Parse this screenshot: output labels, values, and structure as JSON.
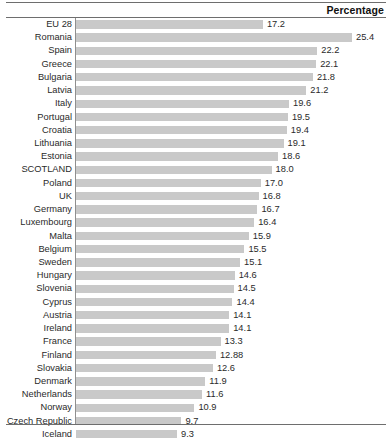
{
  "header": {
    "title": "Percentage"
  },
  "chart_data": {
    "type": "bar",
    "orientation": "horizontal",
    "title": "",
    "subtitle": "",
    "xlabel": "Percentage",
    "ylabel": "",
    "grid": false,
    "legend": null,
    "axis_origin": 0,
    "xlim": [
      0,
      25.4
    ],
    "bar_color": "#c9c9c9",
    "categories": [
      "EU 28",
      "Romania",
      "Spain",
      "Greece",
      "Bulgaria",
      "Latvia",
      "Italy",
      "Portugal",
      "Croatia",
      "Lithuania",
      "Estonia",
      "SCOTLAND",
      "Poland",
      "UK",
      "Germany",
      "Luxembourg",
      "Malta",
      "Belgium",
      "Sweden",
      "Hungary",
      "Slovenia",
      "Cyprus",
      "Austria",
      "Ireland",
      "France",
      "Finland",
      "Slovakia",
      "Denmark",
      "Netherlands",
      "Norway",
      "Czech Republic",
      "Iceland"
    ],
    "values": [
      17.2,
      25.4,
      22.2,
      22.1,
      21.8,
      21.2,
      19.6,
      19.5,
      19.4,
      19.1,
      18.6,
      18.0,
      17.0,
      16.8,
      16.7,
      16.4,
      15.9,
      15.5,
      15.1,
      14.6,
      14.5,
      14.4,
      14.1,
      14.1,
      13.3,
      12.88,
      12.6,
      11.9,
      11.6,
      10.9,
      9.7,
      9.3
    ],
    "value_labels": [
      "17.2",
      "25.4",
      "22.2",
      "22.1",
      "21.8",
      "21.2",
      "19.6",
      "19.5",
      "19.4",
      "19.1",
      "18.6",
      "18.0",
      "17.0",
      "16.8",
      "16.7",
      "16.4",
      "15.9",
      "15.5",
      "15.1",
      "14.6",
      "14.5",
      "14.4",
      "14.1",
      "14.1",
      "13.3",
      "12.88",
      "12.6",
      "11.9",
      "11.6",
      "10.9",
      "9.7",
      "9.3"
    ]
  }
}
